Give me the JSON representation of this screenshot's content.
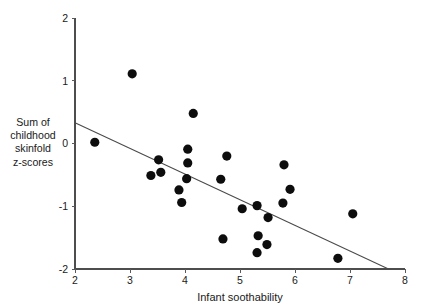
{
  "chart_data": {
    "type": "scatter",
    "title": "",
    "subtitle": "",
    "xlabel": "Infant soothability",
    "ylabel": "Sum of childhood skinfold z-scores",
    "ylabel_lines": [
      "Sum of",
      "childhood",
      "skinfold",
      "z-scores"
    ],
    "xlim": [
      2,
      8
    ],
    "ylim": [
      -2,
      2
    ],
    "xticks": [
      2,
      3,
      4,
      5,
      6,
      7,
      8
    ],
    "xtick_labels": [
      "2",
      "3",
      "4",
      "5",
      "6",
      "7",
      "8"
    ],
    "yticks": [
      -2,
      -1,
      0,
      1,
      2
    ],
    "ytick_labels": [
      "-2",
      "-1",
      "0",
      "1",
      "2"
    ],
    "grid": false,
    "legend": null,
    "legend_position": "none",
    "marker": "filled-circle",
    "marker_color": "#0d0d0d",
    "marker_size": 4.6,
    "points": [
      {
        "x": 2.36,
        "y": 0.02
      },
      {
        "x": 3.04,
        "y": 1.11
      },
      {
        "x": 3.38,
        "y": -0.51
      },
      {
        "x": 3.52,
        "y": -0.26
      },
      {
        "x": 3.56,
        "y": -0.46
      },
      {
        "x": 3.89,
        "y": -0.74
      },
      {
        "x": 3.94,
        "y": -0.94
      },
      {
        "x": 4.03,
        "y": -0.56
      },
      {
        "x": 4.05,
        "y": -0.31
      },
      {
        "x": 4.05,
        "y": -0.09
      },
      {
        "x": 4.15,
        "y": 0.48
      },
      {
        "x": 4.65,
        "y": -0.57
      },
      {
        "x": 4.69,
        "y": -1.52
      },
      {
        "x": 4.76,
        "y": -0.2
      },
      {
        "x": 5.04,
        "y": -1.04
      },
      {
        "x": 5.31,
        "y": -0.99
      },
      {
        "x": 5.31,
        "y": -1.74
      },
      {
        "x": 5.33,
        "y": -1.47
      },
      {
        "x": 5.49,
        "y": -1.61
      },
      {
        "x": 5.51,
        "y": -1.18
      },
      {
        "x": 5.78,
        "y": -0.95
      },
      {
        "x": 5.8,
        "y": -0.34
      },
      {
        "x": 5.91,
        "y": -0.73
      },
      {
        "x": 6.78,
        "y": -1.83
      },
      {
        "x": 7.05,
        "y": -1.12
      }
    ],
    "trend_line": {
      "type": "linear-fit",
      "color": "#4a4a4a",
      "x_start": 2.0,
      "y_start": 0.33,
      "x_end": 7.7,
      "y_end": -2.0
    },
    "axis_color": "#4d4d4d",
    "background_color": "#ffffff"
  }
}
